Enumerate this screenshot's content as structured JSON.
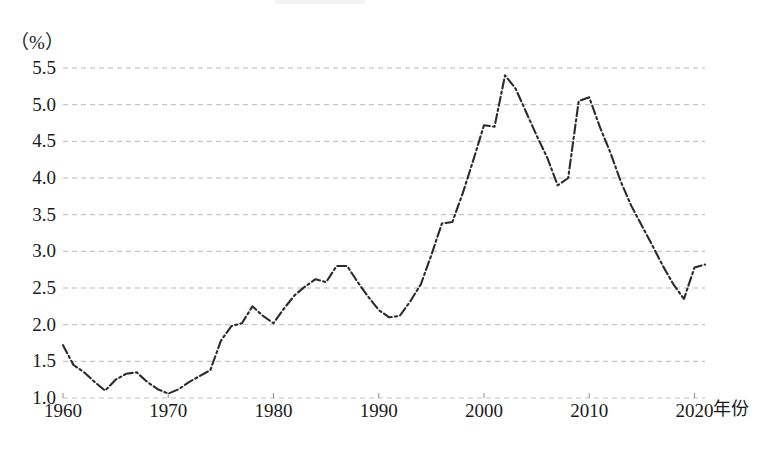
{
  "chart_data": {
    "type": "line",
    "title": "",
    "subtitle": "",
    "xlabel": "年份",
    "ylabel": "（%）",
    "unit_label": "（%）",
    "grid": "horizontal-dashed",
    "legend": "none",
    "line_style": "dash-dot",
    "line_color": "#2b2b2b",
    "grid_color": "#b9b9bd",
    "xlim": [
      1960,
      2021
    ],
    "ylim": [
      1.0,
      5.5
    ],
    "y_ticks": [
      "1.0",
      "1.5",
      "2.0",
      "2.5",
      "3.0",
      "3.5",
      "4.0",
      "4.5",
      "5.0",
      "5.5"
    ],
    "y_tick_values": [
      1.0,
      1.5,
      2.0,
      2.5,
      3.0,
      3.5,
      4.0,
      4.5,
      5.0,
      5.5
    ],
    "x_ticks": [
      "1960",
      "1970",
      "1980",
      "1990",
      "2000",
      "2010",
      "2020"
    ],
    "x_tick_values": [
      1960,
      1970,
      1980,
      1990,
      2000,
      2010,
      2020
    ],
    "x": [
      1960,
      1961,
      1962,
      1963,
      1964,
      1965,
      1966,
      1967,
      1968,
      1969,
      1970,
      1971,
      1972,
      1973,
      1974,
      1975,
      1976,
      1977,
      1978,
      1979,
      1980,
      1981,
      1982,
      1983,
      1984,
      1985,
      1986,
      1987,
      1988,
      1989,
      1990,
      1991,
      1992,
      1993,
      1994,
      1995,
      1996,
      1997,
      1998,
      1999,
      2000,
      2001,
      2002,
      2003,
      2004,
      2005,
      2006,
      2007,
      2008,
      2009,
      2010,
      2011,
      2012,
      2013,
      2014,
      2015,
      2016,
      2017,
      2018,
      2019,
      2020,
      2021
    ],
    "values": [
      1.72,
      1.45,
      1.35,
      1.22,
      1.1,
      1.25,
      1.33,
      1.35,
      1.22,
      1.12,
      1.06,
      1.12,
      1.22,
      1.3,
      1.38,
      1.78,
      1.98,
      2.02,
      2.25,
      2.12,
      2.02,
      2.22,
      2.4,
      2.52,
      2.62,
      2.58,
      2.8,
      2.8,
      2.58,
      2.38,
      2.2,
      2.1,
      2.12,
      2.32,
      2.55,
      2.95,
      3.38,
      3.4,
      3.8,
      4.25,
      4.72,
      4.7,
      5.4,
      5.22,
      4.9,
      4.58,
      4.28,
      3.9,
      4.0,
      5.05,
      5.1,
      4.7,
      4.35,
      3.95,
      3.62,
      3.35,
      3.08,
      2.8,
      2.55,
      2.35,
      2.78,
      2.82
    ],
    "series": [
      {
        "name": "series-1",
        "values": [
          1.72,
          1.45,
          1.35,
          1.22,
          1.1,
          1.25,
          1.33,
          1.35,
          1.22,
          1.12,
          1.06,
          1.12,
          1.22,
          1.3,
          1.38,
          1.78,
          1.98,
          2.02,
          2.25,
          2.12,
          2.02,
          2.22,
          2.4,
          2.52,
          2.62,
          2.58,
          2.8,
          2.8,
          2.58,
          2.38,
          2.2,
          2.1,
          2.12,
          2.32,
          2.55,
          2.95,
          3.38,
          3.4,
          3.8,
          4.25,
          4.72,
          4.7,
          5.4,
          5.22,
          4.9,
          4.58,
          4.28,
          3.9,
          4.0,
          5.05,
          5.1,
          4.7,
          4.35,
          3.95,
          3.62,
          3.35,
          3.08,
          2.8,
          2.55,
          2.35,
          2.78,
          2.82
        ]
      }
    ]
  }
}
